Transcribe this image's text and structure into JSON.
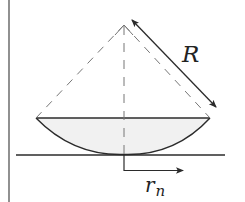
{
  "diagram": {
    "labels": {
      "radius": "R",
      "ring_radius_main": "r",
      "ring_radius_sub": "n"
    },
    "colors": {
      "line": "#2b2b2b",
      "dashed": "#777777",
      "lens_fill": "#f1f1f1",
      "background": "#ffffff"
    },
    "geometry": {
      "apex": [
        124,
        25
      ],
      "chord_left": [
        36,
        118
      ],
      "chord_right": [
        210,
        118
      ],
      "contact_point": [
        124,
        154
      ],
      "plate_y": 155,
      "plate_x": [
        16,
        225
      ],
      "left_border_x": 9,
      "radius_arrow": [
        [
          132,
          20
        ],
        [
          216,
          107
        ]
      ],
      "rn_arrow": [
        [
          124,
          170
        ],
        [
          183,
          170
        ]
      ]
    }
  }
}
